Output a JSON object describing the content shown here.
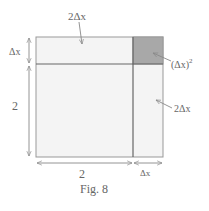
{
  "figure": {
    "caption": "Fig. 8",
    "labels": {
      "top_strip": "2Δx",
      "corner_square": "(Δx)",
      "corner_exp": "2",
      "right_strip": "2Δx",
      "left_top_dim": "Δx",
      "left_main_dim": "2",
      "bottom_main_dim": "2",
      "bottom_right_dim": "Δx"
    },
    "colors": {
      "square_fill": "#f4f4f4",
      "corner_fill": "#a8a8a8",
      "line": "#888888",
      "divider": "#666666"
    }
  }
}
